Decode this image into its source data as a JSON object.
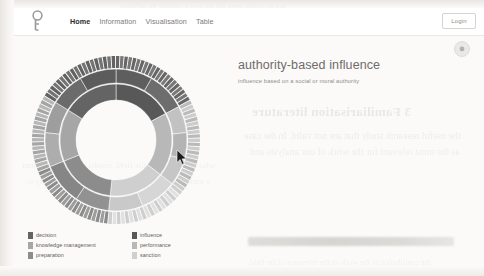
{
  "navbar": {
    "logo_name": "key-logo-icon",
    "links": [
      {
        "label": "Home",
        "active": true
      },
      {
        "label": "Information",
        "active": false
      },
      {
        "label": "Visualisation",
        "active": false
      },
      {
        "label": "Table",
        "active": false
      }
    ],
    "login_label": "Login"
  },
  "toolbar": {
    "settings_label": "settings-icon"
  },
  "header": {
    "title": "authority-based influence",
    "subtitle": "influence based on a social or moral authority"
  },
  "ghost_text": {
    "heading": "3  Familiarisation literature",
    "line1": "the useful research study that are not valid. In the case",
    "line2": "as the most relevant for the work of our analysis and",
    "line3": "who contributes to the field, results under the account",
    "line4": "a number of the most relevant sources that apply to",
    "top_strip": "and the related terms that are used to measure the influence",
    "footer": "the contribution to the work on the relevance of the field"
  },
  "legend": {
    "items": [
      {
        "label": "decision",
        "color": "#646464"
      },
      {
        "label": "knowledge management",
        "color": "#a6a6a6"
      },
      {
        "label": "preparation",
        "color": "#8c8c8c"
      },
      {
        "label": "influence",
        "color": "#585858"
      },
      {
        "label": "performance",
        "color": "#b8b8b8"
      },
      {
        "label": "sanction",
        "color": "#cfcfcf"
      }
    ]
  },
  "chart_data": {
    "type": "pie",
    "title": "authority-based influence",
    "subtitle": "influence based on a social or moral authority",
    "chart_style": "sunburst",
    "center_x": 98,
    "center_y": 86,
    "rings": [
      {
        "name": "inner",
        "inner_radius": 40,
        "outer_radius": 56
      },
      {
        "name": "middle",
        "inner_radius": 57,
        "outer_radius": 71
      },
      {
        "name": "outer",
        "inner_radius": 72,
        "outer_radius": 84
      }
    ],
    "legend_position": "bottom-left",
    "grid": false,
    "categories": [
      "decision",
      "knowledge management",
      "preparation",
      "influence",
      "performance",
      "sanction"
    ],
    "values": [
      18,
      24,
      14,
      16,
      15,
      13
    ],
    "inner_ring": [
      {
        "category": "influence",
        "start_angle": 0,
        "end_angle": 62,
        "color": "#585858"
      },
      {
        "category": "performance",
        "start_angle": 62,
        "end_angle": 128,
        "color": "#b8b8b8"
      },
      {
        "category": "sanction",
        "start_angle": 128,
        "end_angle": 186,
        "color": "#cfcfcf"
      },
      {
        "category": "preparation",
        "start_angle": 186,
        "end_angle": 248,
        "color": "#8c8c8c"
      },
      {
        "category": "knowledge management",
        "start_angle": 248,
        "end_angle": 302,
        "color": "#a6a6a6"
      },
      {
        "category": "decision",
        "start_angle": 302,
        "end_angle": 360,
        "color": "#646464"
      }
    ],
    "middle_ring": [
      {
        "category": "influence",
        "start_angle": 0,
        "end_angle": 30,
        "color": "#5e5e5e"
      },
      {
        "category": "influence",
        "start_angle": 30,
        "end_angle": 62,
        "color": "#6d6d6d"
      },
      {
        "category": "performance",
        "start_angle": 62,
        "end_angle": 84,
        "color": "#c2c2c2"
      },
      {
        "category": "performance",
        "start_angle": 84,
        "end_angle": 106,
        "color": "#b4b4b4"
      },
      {
        "category": "performance",
        "start_angle": 106,
        "end_angle": 128,
        "color": "#c6c6c6"
      },
      {
        "category": "sanction",
        "start_angle": 128,
        "end_angle": 158,
        "color": "#d6d6d6"
      },
      {
        "category": "sanction",
        "start_angle": 158,
        "end_angle": 186,
        "color": "#c9c9c9"
      },
      {
        "category": "preparation",
        "start_angle": 186,
        "end_angle": 214,
        "color": "#929292"
      },
      {
        "category": "preparation",
        "start_angle": 214,
        "end_angle": 248,
        "color": "#868686"
      },
      {
        "category": "knowledge management",
        "start_angle": 248,
        "end_angle": 276,
        "color": "#adadad"
      },
      {
        "category": "knowledge management",
        "start_angle": 276,
        "end_angle": 302,
        "color": "#9e9e9e"
      },
      {
        "category": "decision",
        "start_angle": 302,
        "end_angle": 330,
        "color": "#6b6b6b"
      },
      {
        "category": "decision",
        "start_angle": 330,
        "end_angle": 360,
        "color": "#5c5c5c"
      }
    ],
    "outer_ring_segment_count": 120,
    "outer_ring_groups": [
      {
        "category": "influence",
        "start_angle": 0,
        "end_angle": 62,
        "color": "#6a6a6a"
      },
      {
        "category": "performance",
        "start_angle": 62,
        "end_angle": 128,
        "color": "#bebebe"
      },
      {
        "category": "sanction",
        "start_angle": 128,
        "end_angle": 186,
        "color": "#d2d2d2"
      },
      {
        "category": "preparation",
        "start_angle": 186,
        "end_angle": 248,
        "color": "#8f8f8f"
      },
      {
        "category": "knowledge management",
        "start_angle": 248,
        "end_angle": 302,
        "color": "#a9a9a9"
      },
      {
        "category": "decision",
        "start_angle": 302,
        "end_angle": 360,
        "color": "#666666"
      }
    ]
  },
  "cursor": {
    "x": 180,
    "y": 155
  }
}
